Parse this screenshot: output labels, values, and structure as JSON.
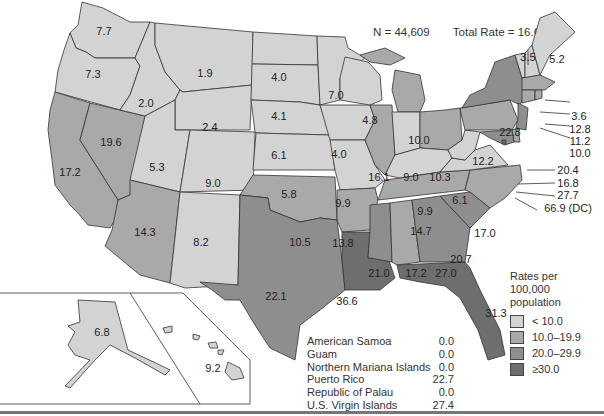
{
  "header": {
    "title_partial": "(title cut off at top edge)",
    "n_label": "N = 44,609",
    "total_rate_label": "Total Rate = 16.6"
  },
  "colors": {
    "lt10": "#d3d3d3",
    "r10_19": "#a9a9a9",
    "r20_29": "#8e8e8e",
    "ge30": "#6e6e6e",
    "border": "#333333"
  },
  "states": {
    "WA": "7.7",
    "OR": "7.3",
    "CA": "17.2",
    "NV": "19.6",
    "ID": "2.0",
    "MT": "1.9",
    "WY": "2.4",
    "UT": "5.3",
    "CO": "9.0",
    "AZ": "14.3",
    "NM": "8.2",
    "ND": "4.0",
    "SD": "4.1",
    "NE": "6.1",
    "KS": "5.8",
    "OK": "10.5",
    "TX": "22.1",
    "MN": "7.0",
    "IA": "4.0",
    "MO": "9.9",
    "AR": "13.8",
    "LA": "36.6",
    "WI": "4.8",
    "IL": "16.1",
    "MI": "10.0",
    "IN": "9.0",
    "OH": "10.3",
    "KY": "9.9",
    "TN": "14.7",
    "MS": "21.0",
    "AL": "17.2",
    "GA": "27.0",
    "FL": "31.3",
    "SC": "20.7",
    "NC": "17.0",
    "VA": "6.1",
    "WV": "6.1",
    "PA": "12.2",
    "NY": "22.8",
    "VT": "3.5",
    "ME": "5.2",
    "NH": "3.6",
    "MA": "12.8",
    "RI": "11.2",
    "CT": "10.0",
    "NJ": "20.4",
    "DE": "16.8",
    "MD": "27.7",
    "DC": "66.9 (DC)",
    "AK": "6.8",
    "HI": "9.2"
  },
  "legend": {
    "title": "Rates per 100,000 population",
    "items": [
      {
        "label": "< 10.0"
      },
      {
        "label": "10.0–19.9"
      },
      {
        "label": "20.0–29.9"
      },
      {
        "label": "≥30.0"
      }
    ]
  },
  "territories": [
    {
      "name": "American Samoa",
      "value": "0.0"
    },
    {
      "name": "Guam",
      "value": "0.0"
    },
    {
      "name": "Northern Mariana Islands",
      "value": "0.0"
    },
    {
      "name": "Puerto Rico",
      "value": "22.7"
    },
    {
      "name": "Republic of Palau",
      "value": "0.0"
    },
    {
      "name": "U.S. Virgin Islands",
      "value": "27.4"
    }
  ]
}
